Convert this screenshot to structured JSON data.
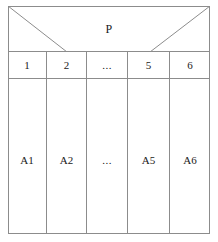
{
  "diagram": {
    "title_label": "P",
    "columns": [
      {
        "index_label": "1",
        "value_label": "A1"
      },
      {
        "index_label": "2",
        "value_label": "A2"
      },
      {
        "index_label": "...",
        "value_label": "..."
      },
      {
        "index_label": "5",
        "value_label": "A5"
      },
      {
        "index_label": "6",
        "value_label": "A6"
      }
    ],
    "colors": {
      "border": "#8c8c8c",
      "background": "#ffffff",
      "text": "#1a1a1a"
    }
  }
}
